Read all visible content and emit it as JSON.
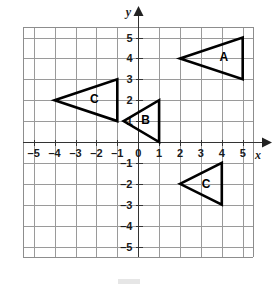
{
  "figure": {
    "background_color": "#ffffff",
    "grid_color": "#9a9a9a",
    "axis_color": "#333333",
    "shape_color": "#000000"
  },
  "chart_data": {
    "type": "scatter",
    "title": "",
    "xlabel": "x",
    "ylabel": "y",
    "xlim": [
      -5.8,
      5.8
    ],
    "ylim": [
      -5.8,
      5.8
    ],
    "grid": true,
    "grid_step": 1,
    "legend": "none",
    "x_ticks": [
      -5,
      -4,
      -3,
      -2,
      -1,
      0,
      1,
      2,
      3,
      4,
      5
    ],
    "y_ticks": [
      5,
      4,
      3,
      2,
      1,
      0,
      -1,
      -2,
      -3,
      -4,
      -5
    ],
    "x_tick_labels": [
      "–5",
      "–4",
      "–3",
      "–2",
      "–1",
      "0",
      "1",
      "2",
      "3",
      "4",
      "5"
    ],
    "y_tick_labels": [
      "5",
      "4",
      "3",
      "2",
      "1",
      "–1",
      "–2",
      "–3",
      "–4",
      "–5"
    ],
    "origin_label": "0",
    "shapes": [
      {
        "name": "triangle-a",
        "label": "A",
        "vertices": [
          [
            2,
            4
          ],
          [
            5,
            5
          ],
          [
            5,
            3
          ]
        ],
        "label_position": [
          4.1,
          4.05
        ]
      },
      {
        "name": "triangle-b",
        "label": "B",
        "vertices": [
          [
            -0.7,
            1
          ],
          [
            1,
            2
          ],
          [
            1,
            0
          ]
        ],
        "label_position": [
          0.35,
          1.05
        ]
      },
      {
        "name": "triangle-c-upper",
        "label": "C",
        "vertices": [
          [
            -4,
            2
          ],
          [
            -1,
            3
          ],
          [
            -1,
            1
          ]
        ],
        "label_position": [
          -2.1,
          2.05
        ]
      },
      {
        "name": "triangle-c-lower",
        "label": "C",
        "vertices": [
          [
            2,
            -2
          ],
          [
            4,
            -1
          ],
          [
            4,
            -3
          ]
        ],
        "label_position": [
          3.25,
          -2.0
        ]
      }
    ]
  }
}
